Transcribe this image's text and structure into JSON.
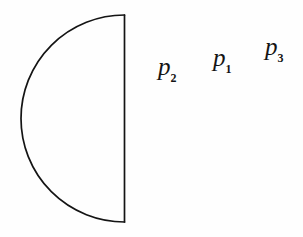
{
  "figure": {
    "background_color": "#fefefe",
    "ink_color": "#141414",
    "width": 303,
    "height": 237,
    "stroke_width": 1.7,
    "shape": {
      "name": "semicircle",
      "orientation": "left-facing-bulge-flat-edge-right",
      "center_x": 124,
      "center_y": 118.5,
      "radius": 102,
      "flat_edge_top_y": 15,
      "flat_edge_bottom_y": 222,
      "leftmost_x": 22
    },
    "labels": [
      {
        "id": "p2",
        "main": "p",
        "subscript": "2",
        "x": 158,
        "y": 54
      },
      {
        "id": "p1",
        "main": "p",
        "subscript": "1",
        "x": 213,
        "y": 45
      },
      {
        "id": "p3",
        "main": "p",
        "subscript": "3",
        "x": 265,
        "y": 34
      }
    ]
  }
}
